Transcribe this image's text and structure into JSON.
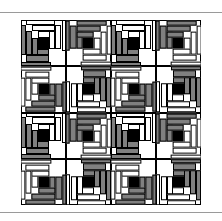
{
  "page": {
    "background_color": "#ffffff",
    "rule_color": "#9a9a9a",
    "rules": [
      {
        "name": "top-rule",
        "y": 12
      },
      {
        "name": "bottom-rule",
        "y": 212
      }
    ]
  },
  "figure": {
    "kind": "quilt-pattern-diagram",
    "pattern_name": "Log Cabin",
    "setting_name": "Straight Furrows",
    "grid_rows": 4,
    "grid_cols": 4,
    "block_count": 16,
    "x": 21,
    "y": 20,
    "width": 180,
    "height": 185
  },
  "palette": {
    "dark_fabric": "#808080",
    "light_fabric": "#ffffff",
    "center_square": "#000000",
    "outline": "#000000"
  },
  "block_spec": {
    "logs_per_block": 12,
    "rounds": 3,
    "center_label": "black center square",
    "dark_side": "two adjacent sides dark",
    "light_side": "two adjacent sides light"
  },
  "block_orientations": [
    [
      "r0",
      "r90",
      "r0",
      "r90"
    ],
    [
      "r270",
      "r180",
      "r270",
      "r180"
    ],
    [
      "r0",
      "r90",
      "r0",
      "r90"
    ],
    [
      "r270",
      "r180",
      "r270",
      "r180"
    ]
  ],
  "logs": [
    {
      "name": "center",
      "tone": "center",
      "x": 38,
      "y": 38,
      "w": 24,
      "h": 24
    },
    {
      "name": "r1-top",
      "tone": "light",
      "x": 38,
      "y": 24,
      "w": 38,
      "h": 14
    },
    {
      "name": "r1-right",
      "tone": "light",
      "x": 62,
      "y": 24,
      "w": 14,
      "h": 38
    },
    {
      "name": "r1-bottom",
      "tone": "dark",
      "x": 24,
      "y": 62,
      "w": 38,
      "h": 14
    },
    {
      "name": "r1-left",
      "tone": "dark",
      "x": 24,
      "y": 38,
      "w": 14,
      "h": 38
    },
    {
      "name": "r2-top",
      "tone": "light",
      "x": 24,
      "y": 10,
      "w": 52,
      "h": 14
    },
    {
      "name": "r2-right",
      "tone": "light",
      "x": 76,
      "y": 10,
      "w": 14,
      "h": 52
    },
    {
      "name": "r2-bottom",
      "tone": "dark",
      "x": 10,
      "y": 76,
      "w": 52,
      "h": 14
    },
    {
      "name": "r2-left",
      "tone": "dark",
      "x": 10,
      "y": 24,
      "w": 14,
      "h": 52
    },
    {
      "name": "r3-top",
      "tone": "light",
      "x": 10,
      "y": 0,
      "w": 66,
      "h": 10
    },
    {
      "name": "r3-right",
      "tone": "light",
      "x": 90,
      "y": 0,
      "w": 10,
      "h": 66
    },
    {
      "name": "r3-bottom",
      "tone": "dark",
      "x": 0,
      "y": 90,
      "w": 66,
      "h": 10
    },
    {
      "name": "r3-left",
      "tone": "dark",
      "x": 0,
      "y": 10,
      "w": 10,
      "h": 66
    }
  ]
}
